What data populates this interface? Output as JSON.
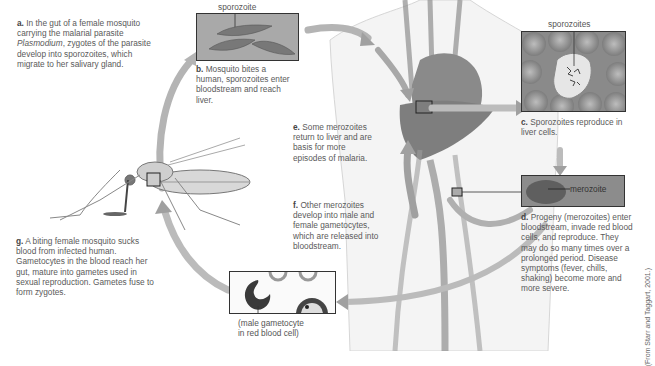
{
  "figure": {
    "credit": "(From Starr and Taggart, 2001.)",
    "steps": [
      {
        "letter": "a.",
        "text_before": "In the gut of a female mosquito carrying the malarial parasite ",
        "italic": "Plasmodium",
        "text_after": ", zygotes of the parasite develop into sporozoites, which migrate to her salivary gland."
      },
      {
        "letter": "b.",
        "text": "Mosquito bites a human, sporozoites enter bloodstream and reach liver."
      },
      {
        "letter": "c.",
        "text": "Sporozoites reproduce in liver cells."
      },
      {
        "letter": "d.",
        "text": "Progeny (merozoites) enter bloodstream, invade red blood cells, and reproduce. They may do so many times over a prolonged period. Disease symptoms (fever, chills, shaking) become more and more severe."
      },
      {
        "letter": "e.",
        "text": "Some merozoites return to liver and are basis for more episodes of malaria."
      },
      {
        "letter": "f.",
        "text": "Other merozoites develop into male and female gametocytes, which are released into bloodstream."
      },
      {
        "letter": "g.",
        "text": "A biting female mosquito sucks blood from infected human. Gametocytes in the blood reach her gut, mature into gametes used in sexual reproduction. Gametes fuse to form zygotes."
      }
    ],
    "labels": {
      "sporozoite": "sporozoite",
      "sporozoites": "sporozoites",
      "merozoite": "merozoite",
      "gametocyte_line1": "(male gametocyte",
      "gametocyte_line2": "in red blood cell)"
    }
  }
}
